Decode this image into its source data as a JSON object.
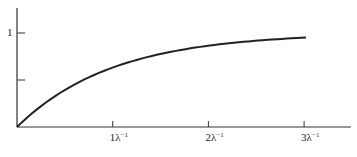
{
  "chart_data": {
    "type": "line",
    "title": "",
    "xlabel": "",
    "ylabel": "",
    "function": "1 - exp(-lambda * t)",
    "x_unit": "λ^-1",
    "x": [
      0,
      0.25,
      0.5,
      0.75,
      1,
      1.5,
      2,
      2.5,
      3
    ],
    "series": [
      {
        "name": "curve",
        "values": [
          0,
          0.221,
          0.393,
          0.528,
          0.632,
          0.777,
          0.865,
          0.918,
          0.95
        ]
      }
    ],
    "xlim": [
      0,
      3.5
    ],
    "ylim": [
      0,
      1.2
    ],
    "x_ticks": [
      1,
      2,
      3
    ],
    "x_tick_labels": [
      {
        "base": "1λ",
        "exp": "−1"
      },
      {
        "base": "2λ",
        "exp": "−1"
      },
      {
        "base": "3λ",
        "exp": "−1"
      }
    ],
    "y_ticks": [
      0.5,
      1
    ],
    "y_tick_labels": [
      "",
      "1"
    ],
    "grid": false,
    "legend": null,
    "colors": {
      "axis": "#333333",
      "line": "#222222"
    }
  }
}
